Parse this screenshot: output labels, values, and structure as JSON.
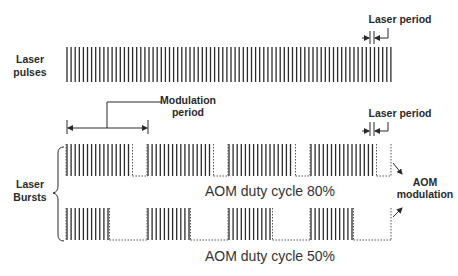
{
  "labels": {
    "laser_pulses_line1": "Laser",
    "laser_pulses_line2": "pulses",
    "laser_bursts_line1": "Laser",
    "laser_bursts_line2": "Bursts",
    "modulation_period_line1": "Modulation",
    "modulation_period_line2": "period",
    "laser_period_top": "Laser period",
    "laser_period_bottom": "Laser period",
    "aom_modulation_line1": "AOM",
    "aom_modulation_line2": "modulation",
    "duty_80": "AOM duty cycle 80%",
    "duty_50": "AOM duty cycle 50%"
  },
  "colors": {
    "pulse": "#2b2b2b",
    "envelope": "#555555",
    "text": "#2a2a2a"
  },
  "pulse_train": {
    "x_start": 67,
    "x_end": 391,
    "spacing": 4.1,
    "y_top": 47,
    "y_bottom": 82
  },
  "bursts": [
    {
      "name": "duty-80",
      "duty_cycle_percent": 80,
      "y_top": 144,
      "y_bottom": 176,
      "segments": [
        [
          67,
          131
        ],
        [
          148,
          212
        ],
        [
          229,
          294
        ],
        [
          311,
          375
        ]
      ],
      "envelope_end": 391
    },
    {
      "name": "duty-50",
      "duty_cycle_percent": 50,
      "y_top": 208,
      "y_bottom": 240,
      "segments": [
        [
          67,
          108
        ],
        [
          148,
          189
        ],
        [
          229,
          271
        ],
        [
          311,
          352
        ]
      ],
      "envelope_end": 391
    }
  ]
}
